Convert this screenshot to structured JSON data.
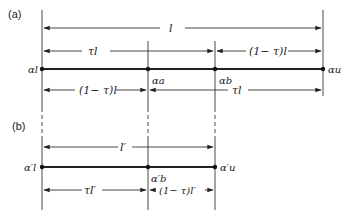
{
  "panels": {
    "a": {
      "label": "(a)",
      "top_dimension": "l",
      "upper_left_dimension": "τl",
      "upper_right_dimension": "(1− τ)l",
      "lower_left_dimension": "(1− τ)l",
      "lower_right_dimension": "τl",
      "points": {
        "left": "αl",
        "a": "αa",
        "b": "αb",
        "right": "αu"
      }
    },
    "b": {
      "label": "(b)",
      "top_dimension": "l′",
      "lower_left_dimension": "τl′",
      "lower_right_dimension": "(1− τ)l′",
      "points": {
        "left": "α′l",
        "b": "α′b",
        "right": "α′u"
      }
    }
  },
  "colors": {
    "line": "#222222",
    "background": "#ffffff"
  }
}
